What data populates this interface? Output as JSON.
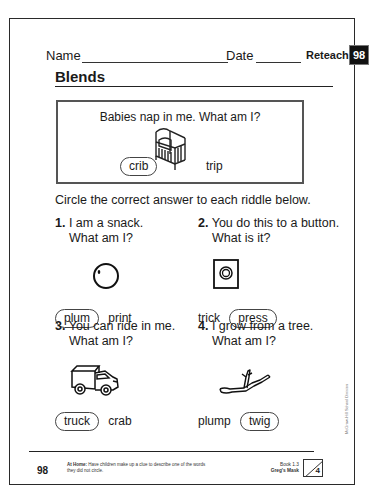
{
  "header": {
    "name_label": "Name",
    "date_label": "Date",
    "reteach_label": "Reteach",
    "reteach_number": "98"
  },
  "title": "Blends",
  "example": {
    "question": "Babies nap in me. What am I?",
    "picture": "crib-icon",
    "choices": [
      {
        "text": "crib",
        "circled": true
      },
      {
        "text": "trip",
        "circled": false
      }
    ]
  },
  "instructions": "Circle the correct answer to each riddle below.",
  "riddles": [
    {
      "number": "1.",
      "line1": "I am a snack.",
      "line2": "What am I?",
      "picture": "plum-icon",
      "choices": [
        {
          "text": "plum",
          "circled": true
        },
        {
          "text": "print",
          "circled": false
        }
      ]
    },
    {
      "number": "2.",
      "line1": "You do this to a button.",
      "line2": "What is it?",
      "picture": "button-icon",
      "choices": [
        {
          "text": "trick",
          "circled": false
        },
        {
          "text": "press",
          "circled": true
        }
      ]
    },
    {
      "number": "3.",
      "line1": "You can ride in me.",
      "line2": "What am I?",
      "picture": "truck-icon",
      "choices": [
        {
          "text": "truck",
          "circled": true
        },
        {
          "text": "crab",
          "circled": false
        }
      ]
    },
    {
      "number": "4.",
      "line1": "I grow from a tree.",
      "line2": "What am I?",
      "picture": "twig-icon",
      "choices": [
        {
          "text": "plump",
          "circled": false
        },
        {
          "text": "twig",
          "circled": true
        }
      ]
    }
  ],
  "side_credit": "McGraw-Hill School Division",
  "footer": {
    "page_number": "98",
    "at_home_label": "At Home:",
    "at_home_text": "Have children make up a clue to describe one of the words they did not circle.",
    "book": "Book 1.3",
    "story": "Greg's Mask",
    "box_number": "4"
  }
}
